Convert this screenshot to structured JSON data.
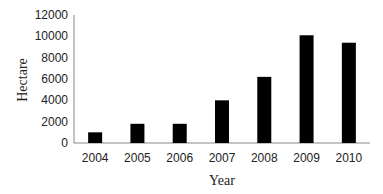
{
  "chart_data": {
    "type": "bar",
    "title": "",
    "xlabel": "Year",
    "ylabel": "Hectare",
    "categories": [
      "2004",
      "2005",
      "2006",
      "2007",
      "2008",
      "2009",
      "2010"
    ],
    "values": [
      1000,
      1800,
      1800,
      4000,
      6200,
      10100,
      9400
    ],
    "ylim": [
      0,
      12000
    ],
    "yticks": [
      0,
      2000,
      4000,
      6000,
      8000,
      10000,
      12000
    ],
    "grid": false,
    "legend": null,
    "bar_color": "#000000"
  }
}
